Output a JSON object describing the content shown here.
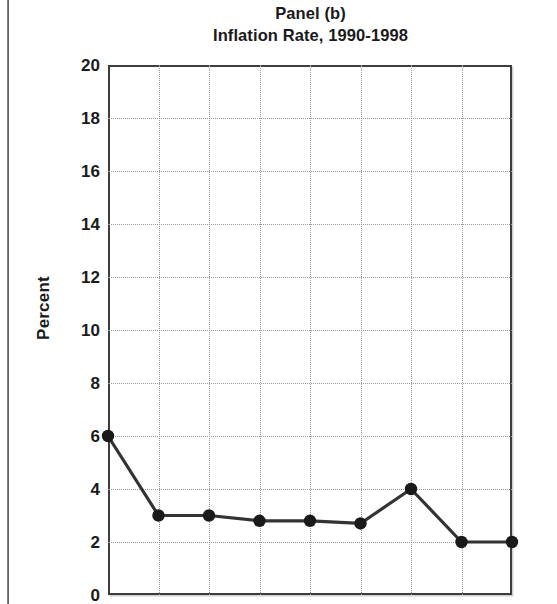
{
  "figure": {
    "title_line_1": "Panel (b)",
    "title_line_2": "Inflation Rate, 1990-1998",
    "ylabel": "Percent"
  },
  "chart_data": {
    "type": "line",
    "title": "Panel (b) Inflation Rate, 1990-1998",
    "subtitle": "Inflation Rate, 1990-1998",
    "xlabel": "",
    "ylabel": "Percent",
    "x": [
      1990,
      1991,
      1992,
      1993,
      1994,
      1995,
      1996,
      1997,
      1998
    ],
    "categories": [
      "1990",
      "1991",
      "1992",
      "1993",
      "1994",
      "1995",
      "1996",
      "1997",
      "1998"
    ],
    "values": [
      6.0,
      3.0,
      3.0,
      2.8,
      2.8,
      2.7,
      4.0,
      2.0,
      2.0
    ],
    "series": [
      {
        "name": "Inflation Rate",
        "values": [
          6.0,
          3.0,
          3.0,
          2.8,
          2.8,
          2.7,
          4.0,
          2.0,
          2.0
        ]
      }
    ],
    "ylim": [
      0,
      20
    ],
    "ytick_values": [
      0,
      2,
      4,
      6,
      8,
      10,
      12,
      14,
      16,
      18,
      20
    ],
    "ytick_labels": [
      "0",
      "2",
      "4",
      "6",
      "8",
      "10",
      "12",
      "14",
      "16",
      "18",
      "20"
    ],
    "xtick_labels": [],
    "grid": true,
    "grid_style": "dotted",
    "legend": false,
    "legend_position": "none",
    "marker": "filled-circle",
    "line_color": "#333333",
    "marker_color": "#1a1a1a",
    "annotations": []
  },
  "colors": {
    "line": "#333333",
    "marker": "#1a1a1a",
    "grid": "#9a9a9a",
    "frame": "#3d3d3d",
    "text": "#1a1a1a",
    "background": "#ffffff"
  }
}
